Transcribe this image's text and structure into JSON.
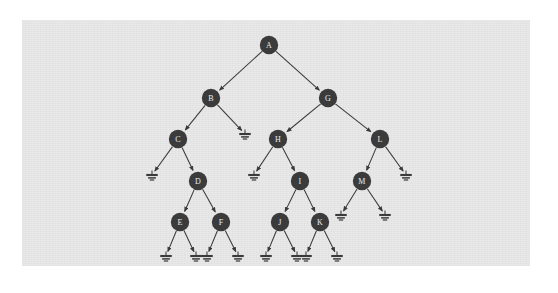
{
  "figure": {
    "panel": {
      "x": 22,
      "y": 20,
      "width": 508,
      "height": 246,
      "background": "#e9e9e9"
    },
    "canvas": {
      "width": 558,
      "height": 293,
      "background": "#ffffff"
    },
    "style": {
      "node_fill": "#3b3b3b",
      "node_label_color": "#ededed",
      "edge_color": "#3a3a3a",
      "node_radius": 9.2,
      "ground_color": "#3a3a3a"
    }
  },
  "chart_data": {
    "type": "diagram",
    "diagram_kind": "binary-tree",
    "node_count": 13,
    "null_pointer_count": 13,
    "root": "A",
    "nodes": [
      {
        "id": "A",
        "label": "A",
        "x": 269,
        "y": 45,
        "depth": 0
      },
      {
        "id": "B",
        "label": "B",
        "x": 211,
        "y": 98,
        "depth": 1
      },
      {
        "id": "G",
        "label": "G",
        "x": 328,
        "y": 98,
        "depth": 1
      },
      {
        "id": "C",
        "label": "C",
        "x": 178,
        "y": 139,
        "depth": 2
      },
      {
        "id": "H",
        "label": "H",
        "x": 278,
        "y": 139,
        "depth": 2
      },
      {
        "id": "L",
        "label": "L",
        "x": 380,
        "y": 139,
        "depth": 2
      },
      {
        "id": "D",
        "label": "D",
        "x": 198,
        "y": 181,
        "depth": 3
      },
      {
        "id": "I",
        "label": "I",
        "x": 300,
        "y": 181,
        "depth": 3
      },
      {
        "id": "M",
        "label": "M",
        "x": 362,
        "y": 181,
        "depth": 3
      },
      {
        "id": "E",
        "label": "E",
        "x": 180,
        "y": 222,
        "depth": 4
      },
      {
        "id": "F",
        "label": "F",
        "x": 221,
        "y": 222,
        "depth": 4
      },
      {
        "id": "J",
        "label": "J",
        "x": 280,
        "y": 222,
        "depth": 4
      },
      {
        "id": "K",
        "label": "K",
        "x": 320,
        "y": 222,
        "depth": 4
      }
    ],
    "edges": [
      {
        "from": "A",
        "to": "B",
        "side": "left"
      },
      {
        "from": "A",
        "to": "G",
        "side": "right"
      },
      {
        "from": "B",
        "to": "C",
        "side": "left"
      },
      {
        "from": "B",
        "to": "n1",
        "side": "right"
      },
      {
        "from": "G",
        "to": "H",
        "side": "left"
      },
      {
        "from": "G",
        "to": "L",
        "side": "right"
      },
      {
        "from": "C",
        "to": "n2",
        "side": "left"
      },
      {
        "from": "C",
        "to": "D",
        "side": "right"
      },
      {
        "from": "H",
        "to": "n3",
        "side": "left"
      },
      {
        "from": "H",
        "to": "I",
        "side": "right"
      },
      {
        "from": "L",
        "to": "M",
        "side": "left"
      },
      {
        "from": "L",
        "to": "n4",
        "side": "right"
      },
      {
        "from": "D",
        "to": "E",
        "side": "left"
      },
      {
        "from": "D",
        "to": "F",
        "side": "right"
      },
      {
        "from": "I",
        "to": "J",
        "side": "left"
      },
      {
        "from": "I",
        "to": "K",
        "side": "right"
      },
      {
        "from": "M",
        "to": "n5",
        "side": "left"
      },
      {
        "from": "M",
        "to": "n6",
        "side": "right"
      },
      {
        "from": "E",
        "to": "n7",
        "side": "left"
      },
      {
        "from": "E",
        "to": "n8",
        "side": "right"
      },
      {
        "from": "F",
        "to": "n9",
        "side": "left"
      },
      {
        "from": "F",
        "to": "n10",
        "side": "right"
      },
      {
        "from": "J",
        "to": "n11",
        "side": "left"
      },
      {
        "from": "J",
        "to": "n12",
        "side": "right"
      },
      {
        "from": "K",
        "to": "n13",
        "side": "left"
      },
      {
        "from": "K",
        "to": "n14",
        "side": "right"
      }
    ],
    "null_pointers": [
      {
        "id": "n1",
        "x": 245,
        "y": 134,
        "parent": "B",
        "side": "right"
      },
      {
        "id": "n2",
        "x": 152,
        "y": 175,
        "parent": "C",
        "side": "left"
      },
      {
        "id": "n3",
        "x": 254,
        "y": 175,
        "parent": "H",
        "side": "left"
      },
      {
        "id": "n4",
        "x": 406,
        "y": 175,
        "parent": "L",
        "side": "right"
      },
      {
        "id": "n5",
        "x": 341,
        "y": 215,
        "parent": "M",
        "side": "left"
      },
      {
        "id": "n6",
        "x": 385,
        "y": 215,
        "parent": "M",
        "side": "right"
      },
      {
        "id": "n7",
        "x": 166,
        "y": 256,
        "parent": "E",
        "side": "left"
      },
      {
        "id": "n8",
        "x": 196,
        "y": 256,
        "parent": "E",
        "side": "right"
      },
      {
        "id": "n9",
        "x": 207,
        "y": 256,
        "parent": "F",
        "side": "left"
      },
      {
        "id": "n10",
        "x": 238,
        "y": 256,
        "parent": "F",
        "side": "right"
      },
      {
        "id": "n11",
        "x": 266,
        "y": 256,
        "parent": "J",
        "side": "left"
      },
      {
        "id": "n12",
        "x": 297,
        "y": 256,
        "parent": "J",
        "side": "right"
      },
      {
        "id": "n13",
        "x": 306,
        "y": 256,
        "parent": "K",
        "side": "left"
      },
      {
        "id": "n14",
        "x": 337,
        "y": 256,
        "parent": "K",
        "side": "right"
      }
    ],
    "adjacency": {
      "A": {
        "left": "B",
        "right": "G"
      },
      "B": {
        "left": "C",
        "right": null
      },
      "G": {
        "left": "H",
        "right": "L"
      },
      "C": {
        "left": null,
        "right": "D"
      },
      "H": {
        "left": null,
        "right": "I"
      },
      "L": {
        "left": "M",
        "right": null
      },
      "D": {
        "left": "E",
        "right": "F"
      },
      "I": {
        "left": "J",
        "right": "K"
      },
      "M": {
        "left": null,
        "right": null
      },
      "E": {
        "left": null,
        "right": null
      },
      "F": {
        "left": null,
        "right": null
      },
      "J": {
        "left": null,
        "right": null
      },
      "K": {
        "left": null,
        "right": null
      }
    }
  }
}
